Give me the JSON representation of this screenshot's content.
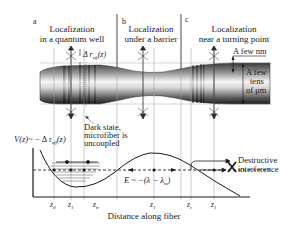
{
  "panels": [
    {
      "letter": "a",
      "title_line1": "Localization",
      "title_line2": "in a quantum well"
    },
    {
      "letter": "b",
      "title_line1": "Localization",
      "title_line2": "under a barrier"
    },
    {
      "letter": "c",
      "title_line1": "Localization",
      "title_line2": "near a turning point"
    }
  ],
  "fiber": {
    "delta_label": "Δ r",
    "delta_sub": "eff",
    "delta_arg": "(z)",
    "scale_nm": "A few nm",
    "scale_um_1": "A few",
    "scale_um_2": "tens",
    "scale_um_3": "of μm"
  },
  "annotations": {
    "dark_state_1": "Dark state,",
    "dark_state_2": "microfiber is",
    "dark_state_3": "uncoupled",
    "destructive_1": "Destructive",
    "destructive_2": "interference"
  },
  "plot": {
    "ylabel_v": "V(z)",
    "ylabel_rel": "~ − Δ r",
    "ylabel_sub": "eff",
    "ylabel_arg": "(z)",
    "energy_label": "E ~ −(λ − λ",
    "energy_sub": "m",
    "energy_close": ")",
    "xlabel": "Distance along fiber",
    "ticks": [
      {
        "base": "z",
        "sub": "tl"
      },
      {
        "base": "z",
        "sub": "1"
      },
      {
        "base": "z",
        "sub": "tr"
      },
      {
        "base": "z",
        "sub": "1"
      },
      {
        "base": "z",
        "sub": "t"
      },
      {
        "base": "z",
        "sub": "1"
      }
    ]
  },
  "colors": {
    "ink": "#1a1a1a",
    "fiber_dark": "#2a2a2a",
    "fiber_light": "#f2f2f2",
    "grid": "#9a9a9a"
  }
}
